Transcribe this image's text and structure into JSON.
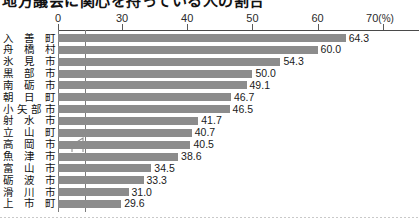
{
  "title": "地方議会に関心を持っている人の割合",
  "axis": {
    "unit_label": "(%)",
    "ticks": [
      {
        "value": 0,
        "label": "0"
      },
      {
        "value": 30,
        "label": "30"
      },
      {
        "value": 40,
        "label": "40"
      },
      {
        "value": 50,
        "label": "50"
      },
      {
        "value": 60,
        "label": "60"
      },
      {
        "value": 70,
        "label": "70"
      }
    ],
    "has_break": true,
    "break_between": [
      0,
      30
    ]
  },
  "chart_data": {
    "type": "bar",
    "orientation": "horizontal",
    "title": "地方議会に関心を持っている人の割合",
    "xlabel": "(%)",
    "ylabel": "",
    "xlim": [
      0,
      70
    ],
    "grid": false,
    "legend": "none",
    "axis_break": "between 0 and 30",
    "categories": [
      "入善町",
      "舟橋村",
      "氷見市",
      "黒部市",
      "南砺市",
      "朝日町",
      "小矢部市",
      "射水市",
      "立山町",
      "高岡市",
      "魚津市",
      "富山市",
      "砺波市",
      "滑川市",
      "上市町"
    ],
    "values": [
      64.3,
      60.0,
      54.3,
      50.0,
      49.1,
      46.7,
      46.5,
      41.7,
      40.7,
      40.5,
      38.6,
      34.5,
      33.3,
      31.0,
      29.6
    ],
    "value_labels": [
      "64.3",
      "60.0",
      "54.3",
      "50.0",
      "49.1",
      "46.7",
      "46.5",
      "41.7",
      "40.7",
      "40.5",
      "38.6",
      "34.5",
      "33.3",
      "31.0",
      "29.6"
    ]
  },
  "colors": {
    "bar": "#8c8c8c",
    "axis": "#4a4a4a",
    "text": "#1a1a1a",
    "background": "#ffffff"
  }
}
